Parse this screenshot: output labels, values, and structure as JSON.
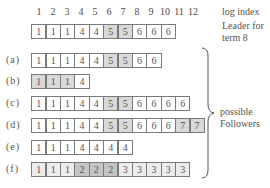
{
  "header": {
    "log_index_label": "log index",
    "leader_label_line1": "Leader for",
    "leader_label_line2": "term 8",
    "indices": [
      "1",
      "2",
      "3",
      "4",
      "5",
      "6",
      "7",
      "8",
      "9",
      "10",
      "11",
      "12"
    ]
  },
  "leader": {
    "terms": [
      "1",
      "1",
      "1",
      "4",
      "4",
      "5",
      "5",
      "6",
      "6",
      "6"
    ],
    "shades": [
      "none",
      "none",
      "none",
      "none",
      "none",
      "mid",
      "mid",
      "none",
      "none",
      "none"
    ]
  },
  "followers": [
    {
      "label": "(a)",
      "terms": [
        "1",
        "1",
        "1",
        "4",
        "4",
        "5",
        "5",
        "6",
        "6"
      ],
      "shades": [
        "none",
        "none",
        "none",
        "none",
        "none",
        "mid",
        "mid",
        "none",
        "none"
      ]
    },
    {
      "label": "(b)",
      "terms": [
        "1",
        "1",
        "1",
        "4"
      ],
      "shades": [
        "mid",
        "mid",
        "mid",
        "none"
      ]
    },
    {
      "label": "(c)",
      "terms": [
        "1",
        "1",
        "1",
        "4",
        "4",
        "5",
        "5",
        "6",
        "6",
        "6",
        "6"
      ],
      "shades": [
        "none",
        "none",
        "none",
        "none",
        "none",
        "mid",
        "mid",
        "none",
        "none",
        "none",
        "none"
      ]
    },
    {
      "label": "(d)",
      "terms": [
        "1",
        "1",
        "1",
        "4",
        "4",
        "5",
        "5",
        "6",
        "6",
        "6",
        "7",
        "7"
      ],
      "shades": [
        "none",
        "none",
        "none",
        "none",
        "none",
        "mid",
        "mid",
        "none",
        "none",
        "none",
        "mid",
        "mid"
      ]
    },
    {
      "label": "(e)",
      "terms": [
        "1",
        "1",
        "1",
        "4",
        "4",
        "4",
        "4"
      ],
      "shades": [
        "none",
        "none",
        "none",
        "none",
        "none",
        "none",
        "none"
      ]
    },
    {
      "label": "(f)",
      "terms": [
        "1",
        "1",
        "1",
        "2",
        "2",
        "2",
        "3",
        "3",
        "3",
        "3",
        "3"
      ],
      "shades": [
        "light",
        "light",
        "light",
        "dark",
        "dark",
        "dark",
        "light",
        "light",
        "light",
        "light",
        "light"
      ]
    }
  ],
  "brace_label": {
    "line1": "possible",
    "line2": "Followers"
  }
}
